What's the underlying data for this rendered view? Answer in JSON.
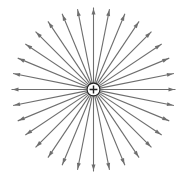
{
  "diagram": {
    "title": "Electric field lines of a positive point charge",
    "charge": {
      "sign": "+",
      "label": "positive-charge",
      "center": [
        93.5,
        89.5
      ],
      "radius": 6.5,
      "fill": "#ffffff",
      "stroke": "#222222"
    },
    "field_lines": {
      "count": 32,
      "direction": "outward",
      "start_radius": 7,
      "end_radius": 82,
      "color": "#6e6e6e",
      "stroke_width": 1.1,
      "arrowhead": {
        "length": 6,
        "half_width": 2,
        "position": "near-tip"
      }
    }
  }
}
